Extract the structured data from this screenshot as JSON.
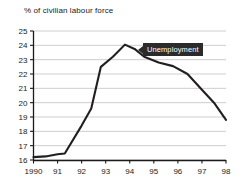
{
  "chart_data": {
    "type": "line",
    "title": "% of civilian labour force",
    "xlabel": "",
    "ylabel": "",
    "ylim": [
      16,
      25
    ],
    "xlim": [
      1990,
      1998
    ],
    "grid": true,
    "legend_position": "inline-callout",
    "y_ticks": [
      "25",
      "24",
      "23",
      "22",
      "21",
      "20",
      "19",
      "18",
      "17",
      "16"
    ],
    "x_ticks": [
      "1990",
      "91",
      "92",
      "93",
      "94",
      "95",
      "96",
      "97",
      "98"
    ],
    "annotations": [
      {
        "text": "Unemployment",
        "points_to_year": 1994.3,
        "points_to_value": 23.7
      }
    ],
    "series": [
      {
        "name": "Unemployment",
        "color": "#231f20",
        "x": [
          1990.0,
          1990.5,
          1991.0,
          1991.3,
          1992.0,
          1992.4,
          1992.8,
          1993.3,
          1993.8,
          1994.2,
          1994.6,
          1995.2,
          1995.8,
          1996.4,
          1997.0,
          1997.5,
          1998.0
        ],
        "values": [
          16.2,
          16.25,
          16.4,
          16.45,
          18.4,
          19.6,
          22.5,
          23.2,
          24.05,
          23.75,
          23.2,
          22.8,
          22.55,
          22.0,
          20.9,
          20.0,
          18.8
        ]
      }
    ]
  },
  "callout": {
    "label": "Unemployment"
  }
}
